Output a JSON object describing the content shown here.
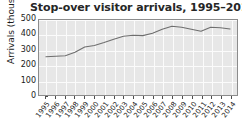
{
  "chart_data": {
    "type": "line",
    "title": "Stop-over visitor arrivals, 1995–2014",
    "xlabel": "",
    "ylabel": "Arrivals (thousands)",
    "ylim": [
      0,
      500
    ],
    "yticks": [
      0,
      100,
      200,
      300,
      400,
      500
    ],
    "ytick_labels": [
      "0",
      "100",
      "200",
      "300",
      "400",
      "500"
    ],
    "grid": true,
    "legend": "none",
    "x": [
      1995,
      1996,
      1997,
      1998,
      1999,
      2000,
      2001,
      2002,
      2003,
      2004,
      2005,
      2006,
      2007,
      2008,
      2009,
      2010,
      2011,
      2012,
      2013,
      2014
    ],
    "xtick_labels": [
      "1995",
      "1996",
      "1997",
      "1998",
      "1999",
      "2000",
      "2001",
      "2002",
      "2003",
      "2004",
      "2005",
      "2006",
      "2007",
      "2008",
      "2009",
      "2010",
      "2011",
      "2012",
      "2013",
      "2014"
    ],
    "values": [
      255,
      258,
      262,
      285,
      320,
      330,
      350,
      372,
      392,
      398,
      396,
      412,
      438,
      458,
      452,
      438,
      425,
      452,
      448,
      440
    ],
    "series": [
      {
        "name": "Stop-over visitor arrivals",
        "color": "#6e6e6e",
        "values": [
          255,
          258,
          262,
          285,
          320,
          330,
          350,
          372,
          392,
          398,
          396,
          412,
          438,
          458,
          452,
          438,
          425,
          452,
          448,
          440
        ]
      }
    ]
  },
  "figure": {
    "background_color": "#ffffff",
    "plot_background_color": "#e7e7e7",
    "gridline_color": "#fbfbfb",
    "axis_color": "#8c8c8c",
    "text_color": "#1a1a1a",
    "title_color": "#262626"
  }
}
